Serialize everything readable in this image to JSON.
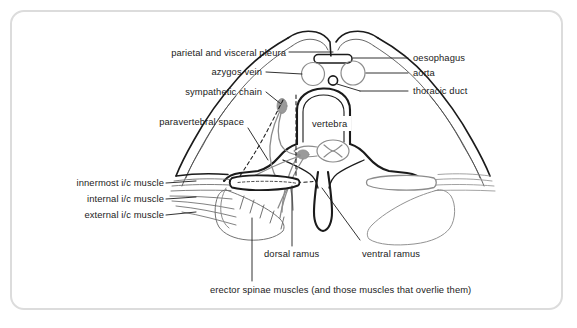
{
  "figure": {
    "type": "anatomical-cross-section",
    "frame_color": "#dcdcdc",
    "background_color": "#ffffff",
    "ink_color": "#1b1b1b",
    "structure_color": "#8c8c8c",
    "labels": {
      "parietal_visceral_pleura": "parietal and visceral pleura",
      "azygos_vein": "azygos vein",
      "sympathetic_chain": "sympathetic chain",
      "paravertebral_space": "paravertebral space",
      "oesophagus": "oesophagus",
      "aorta": "aorta",
      "thoracic_duct": "thoracic duct",
      "vertebra": "vertebra",
      "innermost_ic_muscle": "innermost i/c muscle",
      "internal_ic_muscle": "internal i/c muscle",
      "external_ic_muscle": "external i/c muscle",
      "dorsal_ramus": "dorsal ramus",
      "ventral_ramus": "ventral ramus",
      "erector_spinae": "erector spinae muscles (and those muscles that overlie them)"
    }
  }
}
